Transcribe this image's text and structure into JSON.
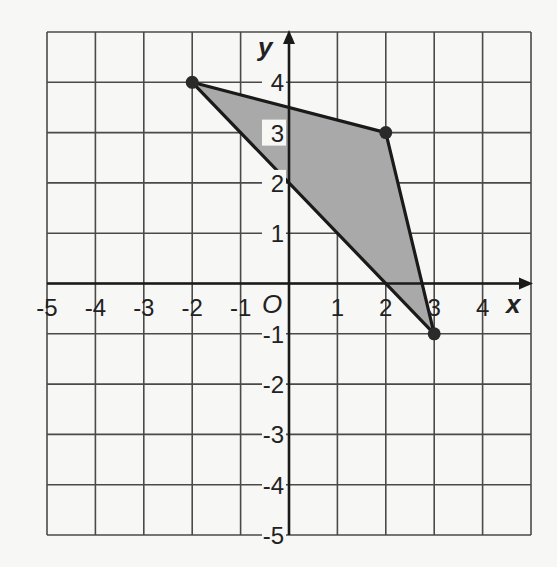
{
  "chart_data": {
    "type": "scatter",
    "title": "",
    "xlabel": "x",
    "ylabel": "y",
    "origin_label": "O",
    "xlim": [
      -5,
      5
    ],
    "ylim": [
      -5,
      5
    ],
    "grid": true,
    "x_ticks": [
      "-5",
      "-4",
      "-3",
      "-2",
      "-1",
      "1",
      "2",
      "3",
      "4"
    ],
    "y_ticks": [
      "4",
      "3",
      "2",
      "1",
      "-1",
      "-2",
      "-3",
      "-4",
      "-5"
    ],
    "shape": {
      "kind": "triangle",
      "fill": "#a9a9a9",
      "vertices": [
        {
          "x": -2,
          "y": 4
        },
        {
          "x": 2,
          "y": 3
        },
        {
          "x": 3,
          "y": -1
        }
      ]
    },
    "points": [
      {
        "x": -2,
        "y": 4
      },
      {
        "x": 2,
        "y": 3
      },
      {
        "x": 3,
        "y": -1
      }
    ]
  },
  "colors": {
    "grid": "#4a4a4a",
    "axis": "#1a1a1a",
    "edge": "#1a1a1a",
    "fill": "#a9a9a9",
    "background": "#f7f7f5"
  }
}
